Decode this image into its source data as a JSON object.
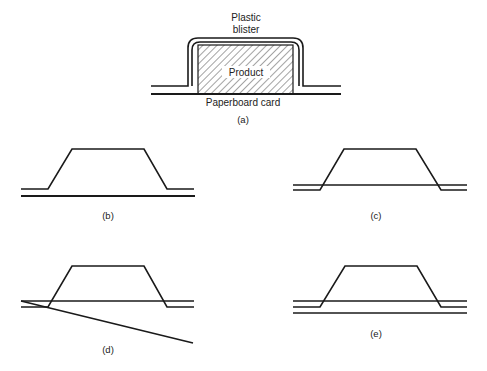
{
  "panels": {
    "a": {
      "caption": "(a)",
      "labels": {
        "blister_line1": "Plastic",
        "blister_line2": "blister",
        "product": "Product",
        "card": "Paperboard card"
      }
    },
    "b": {
      "caption": "(b)"
    },
    "c": {
      "caption": "(c)"
    },
    "d": {
      "caption": "(d)"
    },
    "e": {
      "caption": "(e)"
    }
  },
  "colors": {
    "line": "#1a1a1a",
    "text": "#222222",
    "background": "#ffffff"
  }
}
